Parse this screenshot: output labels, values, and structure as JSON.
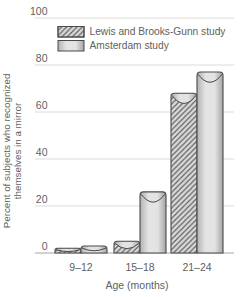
{
  "chart_data": {
    "type": "bar",
    "title": "",
    "categories": [
      "9–12",
      "15–18",
      "21–24"
    ],
    "series": [
      {
        "name": "Lewis and Brooks-Gunn study",
        "style": "hatched",
        "values": [
          2,
          5,
          68
        ]
      },
      {
        "name": "Amsterdam study",
        "style": "solid",
        "values": [
          3,
          26,
          77
        ]
      }
    ],
    "xlabel": "Age (months)",
    "ylabel": "Percent of subjects who recognized themselves in a mirror",
    "ylabel_lines": [
      "Percent of subjects who recognized",
      "themselves in a mirror"
    ],
    "ylim": [
      0,
      100
    ],
    "yticks": [
      0,
      20,
      40,
      60,
      80,
      100
    ],
    "grid": true,
    "legend_position": "top-inside"
  },
  "colors": {
    "background": "#ffffff",
    "text": "#5e5f61",
    "gridline": "#dedbd6",
    "baseline": "#c6c3be",
    "bar_outline": "#4a4a4c",
    "bar_fill_edge": "#b2b2b2",
    "bar_fill_mid": "#e3e3e3",
    "bar_fill_dark": "#a6a6a6",
    "hatch_background": "#d8d8d8",
    "hatch_line": "#5c5c5e"
  }
}
